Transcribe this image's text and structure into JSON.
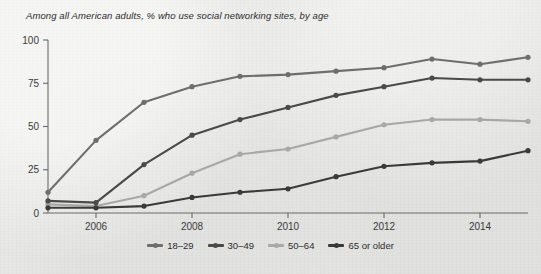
{
  "chart_data": {
    "type": "line",
    "title": "Among all American adults, % who use social networking sites, by age",
    "xlabel": "",
    "ylabel": "",
    "ylim": [
      0,
      100
    ],
    "xlim": [
      2005,
      2015
    ],
    "yticks": [
      "0",
      "25",
      "50",
      "75",
      "100"
    ],
    "ytick_values": [
      0,
      25,
      50,
      75,
      100
    ],
    "xticks": [
      "2006",
      "2008",
      "2010",
      "2012",
      "2014"
    ],
    "xtick_values": [
      2006,
      2008,
      2010,
      2012,
      2014
    ],
    "grid": false,
    "legend_position": "bottom-center",
    "x": [
      2005,
      2006,
      2007,
      2008,
      2009,
      2010,
      2011,
      2012,
      2013,
      2014,
      2015
    ],
    "series": [
      {
        "name": "18–29",
        "color": "#6e6e6e",
        "values": [
          12,
          42,
          64,
          73,
          79,
          80,
          82,
          84,
          89,
          86,
          90
        ]
      },
      {
        "name": "30–49",
        "color": "#4a4a4a",
        "values": [
          7,
          6,
          28,
          45,
          54,
          61,
          68,
          73,
          78,
          77,
          77
        ]
      },
      {
        "name": "50–64",
        "color": "#a8a8a8",
        "values": [
          5,
          4,
          10,
          23,
          34,
          37,
          44,
          51,
          54,
          54,
          53
        ]
      },
      {
        "name": "65 or older",
        "color": "#3a3a3a",
        "values": [
          3,
          3,
          4,
          9,
          12,
          14,
          21,
          27,
          29,
          30,
          36
        ]
      }
    ]
  },
  "axis": {
    "line_color": "#6a6a6a"
  }
}
